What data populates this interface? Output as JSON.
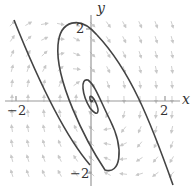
{
  "chart_data": {
    "type": "phase-portrait",
    "title": "",
    "xlabel": "x",
    "ylabel": "y",
    "xlim": [
      -2.4,
      2.6
    ],
    "ylim": [
      -2.4,
      2.6
    ],
    "x_ticks": [
      "-2",
      "2"
    ],
    "y_ticks": [
      "2",
      "-2"
    ],
    "elements": [
      "direction field (gray arrows)",
      "spiral trajectory converging to origin",
      "two straight-ish separatrix-like trajectories"
    ],
    "colors": {
      "axis": "#999999",
      "curve": "#444444",
      "arrows": "#c8c8c8"
    }
  },
  "labels": {
    "x_axis": "x",
    "y_axis": "y",
    "x_pos_tick": "2",
    "x_neg_tick": "−2",
    "y_pos_tick": "2",
    "y_neg_tick": "−2"
  }
}
